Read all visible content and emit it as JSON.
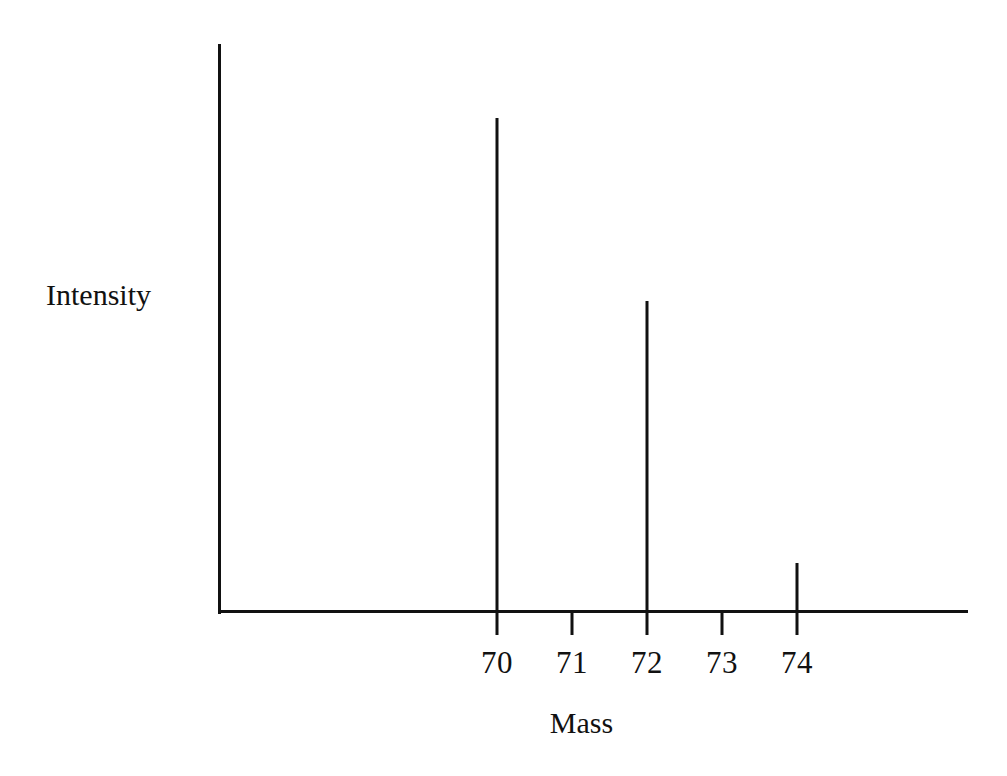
{
  "chart_data": {
    "type": "bar",
    "title": "",
    "subtitle": "",
    "xlabel": "Mass",
    "ylabel": "Intensity",
    "categories": [
      "70",
      "71",
      "72",
      "73",
      "74"
    ],
    "x": [
      70,
      71,
      72,
      73,
      74
    ],
    "values": [
      100,
      0,
      63,
      0,
      10
    ],
    "tick_labels": [
      "70",
      "71",
      "72",
      "73",
      "74"
    ],
    "xlim": [
      69.3,
      76.6
    ],
    "ylim": [
      0,
      115
    ],
    "grid": false,
    "legend": null,
    "annotations": [],
    "series": [
      {
        "name": "Relative intensity",
        "values": [
          100,
          0,
          63,
          0,
          10
        ]
      }
    ],
    "peaks": [
      {
        "mass": "70",
        "intensity_pct": 100
      },
      {
        "mass": "72",
        "intensity_pct": 63
      },
      {
        "mass": "74",
        "intensity_pct": 10
      }
    ],
    "colors": {
      "axis": "#111111",
      "peak": "#111111",
      "background": "#ffffff",
      "text": "#111111"
    }
  }
}
